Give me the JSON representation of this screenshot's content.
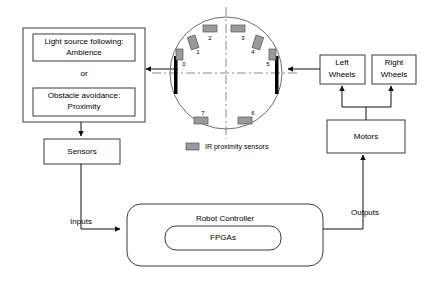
{
  "diagram": {
    "behavior_panel": {
      "options": [
        {
          "name": "light-source-following",
          "line1": "Light source following:",
          "line2": "Ambience"
        },
        {
          "name": "obstacle-avoidance",
          "line1": "Obstacle avoidance:",
          "line2": "Proximity"
        }
      ],
      "connector_label": "or"
    },
    "blocks": [
      {
        "id": "sensors",
        "label": "Sensors"
      },
      {
        "id": "robot-controller",
        "label": "Robot Controller"
      },
      {
        "id": "fpgas",
        "label": "FPGAs"
      },
      {
        "id": "left-wheels",
        "line1": "Left",
        "line2": "Wheels"
      },
      {
        "id": "right-wheels",
        "line1": "Right",
        "line2": "Wheels"
      },
      {
        "id": "motors",
        "label": "Motors"
      }
    ],
    "flow_labels": {
      "inputs": "Inputs",
      "outputs": "Outputs"
    },
    "robot": {
      "legend_text": "IR proximity sensors",
      "sensor_numbers": [
        "0",
        "1",
        "2",
        "3",
        "4",
        "5",
        "6",
        "7"
      ],
      "wheel_count": 2
    },
    "colors": {
      "stroke": "#3b3b3b",
      "text": "#000000",
      "sensor_fill": "#9a9a9a",
      "sensor_stroke": "#555555",
      "wheel_fill": "#000000",
      "background": "#ffffff"
    }
  }
}
